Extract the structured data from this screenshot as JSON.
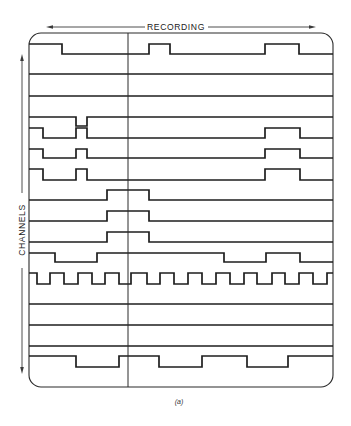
{
  "labels": {
    "recording": "RECORDING",
    "channels": "CHANNELS",
    "caption": "(a)"
  },
  "colors": {
    "trace": "#1e1e1e",
    "frame": "#2a2a2a",
    "background": "#ffffff"
  },
  "plot": {
    "x_start": 29,
    "x_end": 333,
    "cursor_x": 128
  },
  "channels": [
    {
      "id": 1,
      "high_y": 44,
      "low_y": 54,
      "start": "high",
      "edges": [
        62,
        149,
        170,
        265,
        299
      ]
    },
    {
      "id": 2,
      "high_y": 74,
      "low_y": 74,
      "start": "high",
      "edges": []
    },
    {
      "id": 3,
      "high_y": 96,
      "low_y": 96,
      "start": "high",
      "edges": []
    },
    {
      "id": 4,
      "high_y": 117,
      "low_y": 126,
      "start": "high",
      "edges": [
        76,
        87
      ]
    },
    {
      "id": 5,
      "high_y": 128,
      "low_y": 138,
      "start": "high",
      "edges": [
        43,
        76,
        87,
        265,
        300
      ]
    },
    {
      "id": 6,
      "high_y": 149,
      "low_y": 158,
      "start": "high",
      "edges": [
        43,
        76,
        87,
        265,
        300
      ]
    },
    {
      "id": 7,
      "high_y": 169,
      "low_y": 180,
      "start": "high",
      "edges": [
        43,
        76,
        87,
        265,
        300
      ]
    },
    {
      "id": 8,
      "high_y": 190,
      "low_y": 200,
      "start": "low",
      "edges": [
        107,
        149
      ]
    },
    {
      "id": 9,
      "high_y": 211,
      "low_y": 221,
      "start": "low",
      "edges": [
        107,
        149
      ]
    },
    {
      "id": 10,
      "high_y": 232,
      "low_y": 242,
      "start": "low",
      "edges": [
        107,
        149
      ]
    },
    {
      "id": 11,
      "high_y": 253,
      "low_y": 262,
      "start": "high",
      "edges": [
        55,
        97,
        224,
        266,
        300
      ]
    },
    {
      "id": 12,
      "high_y": 273,
      "low_y": 284,
      "start": "high",
      "edges": [
        37,
        50,
        64,
        78,
        92,
        105,
        119,
        131,
        147,
        160,
        174,
        188,
        202,
        216,
        230,
        244,
        257,
        272,
        285,
        299,
        313,
        327
      ]
    },
    {
      "id": 13,
      "high_y": 304,
      "low_y": 304,
      "start": "high",
      "edges": []
    },
    {
      "id": 14,
      "high_y": 325,
      "low_y": 325,
      "start": "high",
      "edges": []
    },
    {
      "id": 15,
      "high_y": 346,
      "low_y": 346,
      "start": "high",
      "edges": []
    },
    {
      "id": 16,
      "high_y": 356,
      "low_y": 367,
      "start": "high",
      "edges": [
        76,
        119,
        159,
        202,
        247,
        288
      ]
    }
  ]
}
